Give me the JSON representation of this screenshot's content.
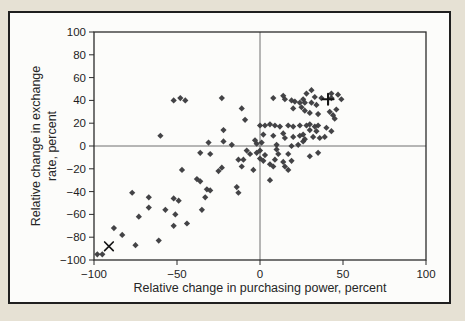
{
  "figure": {
    "page_background_color": "#e6e1d4",
    "panel_color": "#fcfcfa",
    "frame_color": "#1f1f1f",
    "axis_color": "#2b2b2b",
    "zero_line_color": "#606060",
    "text_color": "#1e1e1e"
  },
  "chart_data": {
    "type": "scatter",
    "title": "",
    "xlabel": "Relative change in purchasing power, percent",
    "ylabel": "Relative change in exchange rate, percent",
    "ylabel_line1": "Relative change in exchange",
    "ylabel_line2": "rate, percent",
    "xlim": [
      -100,
      100
    ],
    "ylim": [
      -100,
      100
    ],
    "x_ticks": [
      -100,
      -50,
      0,
      50,
      100
    ],
    "x_tick_labels": [
      "−100",
      "−50",
      "0",
      "50",
      "100"
    ],
    "y_ticks": [
      100,
      80,
      60,
      40,
      20,
      0,
      -20,
      -40,
      -60,
      -80,
      -100
    ],
    "y_tick_labels": [
      "100",
      "80",
      "60",
      "40",
      "20",
      "0",
      "−20",
      "−40",
      "−60",
      "−80",
      "−100"
    ],
    "grid": "zero-lines-only",
    "legend": "none",
    "marker": "diamond",
    "marker_color": "#3a3a3c",
    "points": [
      [
        -52,
        40
      ],
      [
        -48,
        42
      ],
      [
        -45,
        40
      ],
      [
        -60,
        9
      ],
      [
        -23,
        42
      ],
      [
        -11,
        33
      ],
      [
        -22,
        14
      ],
      [
        -31,
        3
      ],
      [
        -22,
        4
      ],
      [
        -17,
        1
      ],
      [
        -9,
        23
      ],
      [
        -3,
        5
      ],
      [
        -2,
        2
      ],
      [
        1,
        3
      ],
      [
        2,
        10
      ],
      [
        0,
        18
      ],
      [
        3,
        18
      ],
      [
        6,
        19
      ],
      [
        9,
        18
      ],
      [
        12,
        17
      ],
      [
        17,
        18
      ],
      [
        20,
        17
      ],
      [
        24,
        18
      ],
      [
        28,
        18
      ],
      [
        30,
        19
      ],
      [
        33,
        17
      ],
      [
        35,
        18
      ],
      [
        30,
        14
      ],
      [
        34,
        13
      ],
      [
        40,
        16
      ],
      [
        43,
        13
      ],
      [
        8,
        9
      ],
      [
        14,
        11
      ],
      [
        15,
        7
      ],
      [
        20,
        8
      ],
      [
        24,
        9
      ],
      [
        26,
        10
      ],
      [
        27,
        6
      ],
      [
        26,
        4
      ],
      [
        32,
        8
      ],
      [
        36,
        7
      ],
      [
        39,
        8
      ],
      [
        10,
        1
      ],
      [
        19,
        0
      ],
      [
        23,
        1
      ],
      [
        8,
        42
      ],
      [
        14,
        44
      ],
      [
        15,
        41
      ],
      [
        19,
        40
      ],
      [
        21,
        39
      ],
      [
        24,
        38
      ],
      [
        31,
        49
      ],
      [
        28,
        46
      ],
      [
        26,
        41
      ],
      [
        33,
        43
      ],
      [
        37,
        42
      ],
      [
        43,
        46
      ],
      [
        43,
        42
      ],
      [
        47,
        45
      ],
      [
        49,
        41
      ],
      [
        27,
        38
      ],
      [
        31,
        38
      ],
      [
        34,
        36
      ],
      [
        20,
        33
      ],
      [
        25,
        34
      ],
      [
        27,
        31
      ],
      [
        30,
        29
      ],
      [
        35,
        28
      ],
      [
        42,
        30
      ],
      [
        44,
        27
      ],
      [
        46,
        32
      ],
      [
        45,
        24
      ],
      [
        0,
        -4
      ],
      [
        -2,
        -6
      ],
      [
        10,
        -3
      ],
      [
        3,
        -8
      ],
      [
        11,
        -7
      ],
      [
        17,
        -7
      ],
      [
        0,
        -11
      ],
      [
        2,
        -13
      ],
      [
        9,
        -12
      ],
      [
        6,
        -16
      ],
      [
        8,
        -18
      ],
      [
        14,
        -14
      ],
      [
        15,
        -18
      ],
      [
        19,
        -13
      ],
      [
        17,
        -21
      ],
      [
        6,
        -30
      ],
      [
        30,
        -9
      ],
      [
        35,
        -6
      ],
      [
        -8,
        -4
      ],
      [
        -6,
        -7
      ],
      [
        -10,
        -12
      ],
      [
        -13,
        -12
      ],
      [
        -11,
        -18
      ],
      [
        -4,
        -21
      ],
      [
        -23,
        -19
      ],
      [
        -25,
        -22
      ],
      [
        -36,
        -6
      ],
      [
        -30,
        -7
      ],
      [
        -47,
        -21
      ],
      [
        -14,
        -36
      ],
      [
        -13,
        -41
      ],
      [
        -38,
        -29
      ],
      [
        -36,
        -31
      ],
      [
        -32,
        -38
      ],
      [
        -30,
        -39
      ],
      [
        -33,
        -45
      ],
      [
        -35,
        -56
      ],
      [
        -51,
        -60
      ],
      [
        -44,
        -68
      ],
      [
        -77,
        -41
      ],
      [
        -67,
        -45
      ],
      [
        -52,
        -46
      ],
      [
        -49,
        -48
      ],
      [
        -67,
        -54
      ],
      [
        -57,
        -56
      ],
      [
        -73,
        -62
      ],
      [
        -52,
        -70
      ],
      [
        -88,
        -72
      ],
      [
        -83,
        -78
      ],
      [
        -61,
        -83
      ],
      [
        -75,
        -87
      ],
      [
        -98,
        -95
      ],
      [
        -95,
        -95
      ]
    ],
    "special_markers": [
      {
        "symbol": "x",
        "x": -91,
        "y": -88
      },
      {
        "symbol": "+",
        "x": 41,
        "y": 41
      }
    ]
  }
}
